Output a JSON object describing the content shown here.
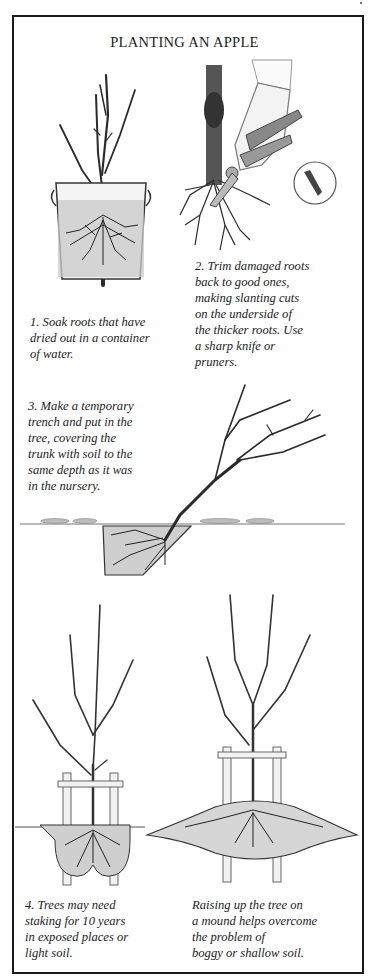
{
  "page": {
    "title": "PLANTING AN APPLE"
  },
  "steps": [
    {
      "id": "soak",
      "lines": [
        "1.  Soak roots that have",
        "dried out in a container",
        "of water."
      ]
    },
    {
      "id": "trim",
      "lines": [
        "2.  Trim damaged roots",
        "back to good ones,",
        "making slanting cuts",
        "on the underside of",
        "the thicker roots. Use",
        "a sharp knife or",
        "pruners."
      ]
    },
    {
      "id": "trench",
      "lines": [
        "3.  Make a temporary",
        "trench and put in the",
        "tree, covering the",
        "trunk with soil to the",
        "same depth as it was",
        "in the nursery."
      ]
    },
    {
      "id": "staking",
      "lines": [
        "4.  Trees may need",
        "staking for 10 years",
        "in exposed places or",
        "light soil."
      ]
    },
    {
      "id": "mound",
      "lines": [
        "Raising up the tree on",
        "a mound helps overcome",
        "the problem of",
        "boggy or shallow soil."
      ]
    }
  ],
  "illustrations": [
    {
      "id": "tree-in-bucket",
      "icon": "tree-bucket-icon"
    },
    {
      "id": "pruning-roots",
      "icon": "pruner-hand-icon"
    },
    {
      "id": "slanting-cut-detail",
      "icon": "magnified-cut-icon"
    },
    {
      "id": "heeled-in-tree",
      "icon": "trench-tree-icon"
    },
    {
      "id": "staked-tree",
      "icon": "staked-tree-icon"
    },
    {
      "id": "mound-planted-tree",
      "icon": "mound-tree-icon"
    }
  ],
  "colors": {
    "ink": "#1c1c1c",
    "paper": "#ffffff",
    "soil": "#bdbdbd",
    "water": "#c9c9c9"
  }
}
